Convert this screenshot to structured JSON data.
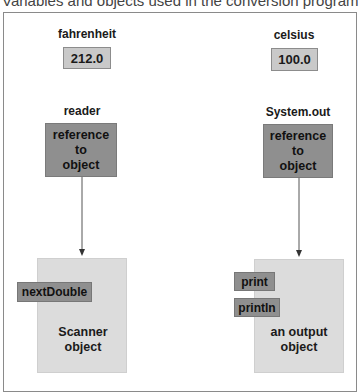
{
  "caption": "Variables and objects used in the conversion program",
  "variables": [
    {
      "name": "fahrenheit",
      "value": "212.0"
    },
    {
      "name": "celsius",
      "value": "100.0"
    }
  ],
  "references": [
    {
      "name": "reader",
      "box_lines": [
        "reference",
        "to",
        "object"
      ],
      "object": {
        "lines": [
          "Scanner",
          "object"
        ],
        "methods": [
          "nextDouble"
        ]
      }
    },
    {
      "name": "System.out",
      "box_lines": [
        "reference",
        "to",
        "object"
      ],
      "object": {
        "lines": [
          "an output",
          "object"
        ],
        "methods": [
          "print",
          "println"
        ]
      }
    }
  ],
  "colors": {
    "value_box": "#c9c9c9",
    "reference_box": "#8f8f8f",
    "object_box": "#dcdcdc",
    "method_box": "#8f8f8f",
    "frame_border": "#8a8a8a"
  }
}
